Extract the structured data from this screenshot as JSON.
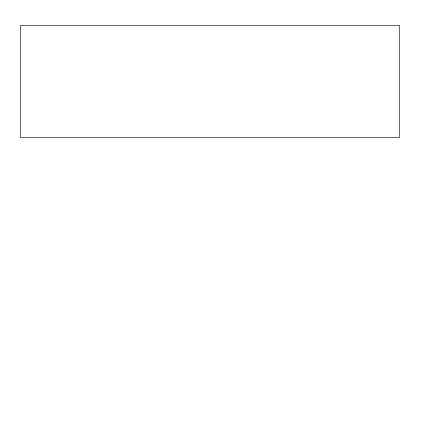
{
  "diagram": {
    "left_header": [
      "DURATION",
      "(SEC)"
    ],
    "right_header": [
      "POWER",
      "TEST"
    ],
    "durations": [
      "1080",
      "300",
      "100",
      "60",
      "30",
      "10",
      "5",
      "1",
      "0.5",
      "0"
    ],
    "tests": [
      {
        "line1": "PWC",
        "sub": "170",
        "line2": ""
      },
      {
        "line1": "ROWING",
        "line2": "ERGOMETER"
      },
      {
        "line1": "CUNNINGHAM",
        "line2": "FAULKNER"
      },
      {
        "line1": "WINGATE",
        "line2": "TEST"
      },
      {
        "line1": "ISOKINETIC",
        "line2": "TESTS"
      },
      {
        "line1": "MARGARIA",
        "line2": "TEST"
      },
      {
        "line1": "VERTICAL",
        "line2": "JUMP"
      }
    ],
    "mappings": [
      {
        "duration": "1080",
        "test": "PWC170"
      },
      {
        "duration": "300",
        "test": "ROWING ERGOMETER"
      },
      {
        "duration": "100-60",
        "test": "CUNNINGHAM FAULKNER"
      },
      {
        "duration": "30",
        "test": "WINGATE TEST"
      },
      {
        "duration": "10-5",
        "test": "ISOKINETIC TESTS"
      },
      {
        "duration": "1-0.5",
        "test": "MARGARIA TEST"
      },
      {
        "duration": "0",
        "test": "VERTICAL JUMP"
      }
    ],
    "colors": {
      "line": "#333333",
      "shadow": "#8c8c8c",
      "frame": "#6a6a6a"
    }
  }
}
